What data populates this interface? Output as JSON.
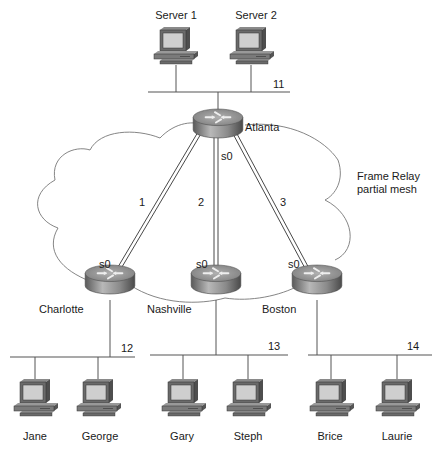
{
  "diagram": {
    "cloud_label_line1": "Frame Relay",
    "cloud_label_line2": "partial mesh",
    "colors": {
      "line": "#555555",
      "router_top": "#9a9a9a",
      "router_side": "#6e6e6e",
      "screen": "#c8c8c8",
      "pc_body": "#7a7a7a"
    },
    "servers": [
      {
        "name": "Server 1"
      },
      {
        "name": "Server 2"
      }
    ],
    "routers": {
      "hub": {
        "name": "Atlanta",
        "interface": "s0"
      },
      "spokes": [
        {
          "name": "Charlotte",
          "interface": "s0"
        },
        {
          "name": "Nashville",
          "interface": "s0"
        },
        {
          "name": "Boston",
          "interface": "s0"
        }
      ]
    },
    "pvcs": [
      {
        "label": "1",
        "from": "Atlanta",
        "to": "Charlotte"
      },
      {
        "label": "2",
        "from": "Atlanta",
        "to": "Nashville"
      },
      {
        "label": "3",
        "from": "Atlanta",
        "to": "Boston"
      }
    ],
    "subnets": [
      {
        "label": "11",
        "router": "Atlanta"
      },
      {
        "label": "12",
        "router": "Charlotte"
      },
      {
        "label": "13",
        "router": "Nashville"
      },
      {
        "label": "14",
        "router": "Boston"
      }
    ],
    "hosts": [
      {
        "name": "Jane",
        "subnet": "12"
      },
      {
        "name": "George",
        "subnet": "12"
      },
      {
        "name": "Gary",
        "subnet": "13"
      },
      {
        "name": "Steph",
        "subnet": "13"
      },
      {
        "name": "Brice",
        "subnet": "14"
      },
      {
        "name": "Laurie",
        "subnet": "14"
      }
    ]
  }
}
